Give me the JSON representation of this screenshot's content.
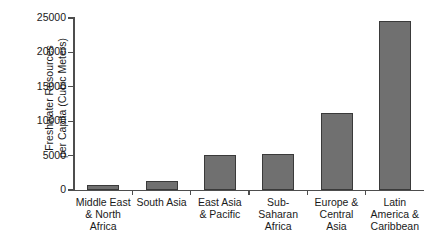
{
  "chart_data": {
    "type": "bar",
    "title": "",
    "xlabel": "",
    "ylabel": "Freshwater Resources per Capita (Cubic Meters)",
    "ylabel_line1": "Freshwater Resources",
    "ylabel_line2": "per Capita (Cubic Meters)",
    "categories": [
      "Middle East\n& North\nAfrica",
      "South Asia",
      "East Asia\n& Pacific",
      "Sub-\nSaharan\nAfrica",
      "Europe &\nCentral\nAsia",
      "Latin\nAmerica &\nCaribbean"
    ],
    "values": [
      700,
      1300,
      5100,
      5300,
      11200,
      24500
    ],
    "ylim": [
      0,
      25000
    ],
    "yticks": [
      0,
      5000,
      10000,
      15000,
      20000,
      25000
    ],
    "ytick_labels": [
      "0",
      "5000",
      "10000",
      "15000",
      "20000",
      "25000"
    ],
    "grid": false,
    "legend": false,
    "bar_color": "#707070",
    "bar_edge_color": "#3a3a3a",
    "axis_color": "#4d4d4d",
    "text_color": "#1a1a1a",
    "background": "#ffffff"
  }
}
